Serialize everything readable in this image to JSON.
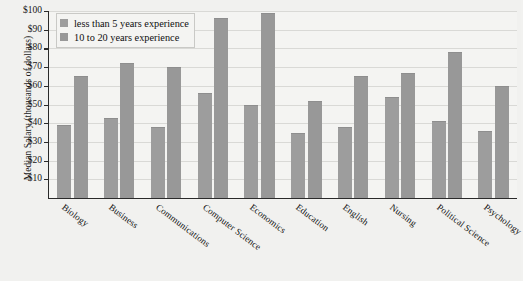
{
  "chart_data": {
    "type": "bar",
    "title": "",
    "xlabel": "",
    "ylabel": "Median Salary (thousands of dollars)",
    "ylim": [
      0,
      100
    ],
    "ytick_labels": [
      "$100",
      "$90",
      "$80",
      "$70",
      "$60",
      "$50",
      "$40",
      "$30",
      "$20",
      "$10"
    ],
    "ytick_values": [
      100,
      90,
      80,
      70,
      60,
      50,
      40,
      30,
      20,
      10
    ],
    "grid": true,
    "legend_position": "upper left",
    "categories": [
      "Biology",
      "Business",
      "Communications",
      "Computer Science",
      "Economics",
      "Education",
      "English",
      "Nursing",
      "Political Science",
      "Psychology"
    ],
    "series": [
      {
        "name": "less than 5 years experience",
        "color": "#9d9d9d",
        "values": [
          39,
          43,
          38,
          56,
          50,
          35,
          38,
          54,
          41,
          36
        ]
      },
      {
        "name": "10 to 20 years experience",
        "color": "#989898",
        "values": [
          65,
          72,
          70,
          96,
          99,
          52,
          65,
          67,
          78,
          60
        ]
      }
    ]
  },
  "legend": {
    "items": [
      {
        "label": "less than 5 years experience",
        "swatch": "legend-swatch-series-0"
      },
      {
        "label": "10 to 20 years experience",
        "swatch": "legend-swatch-series-1"
      }
    ]
  }
}
